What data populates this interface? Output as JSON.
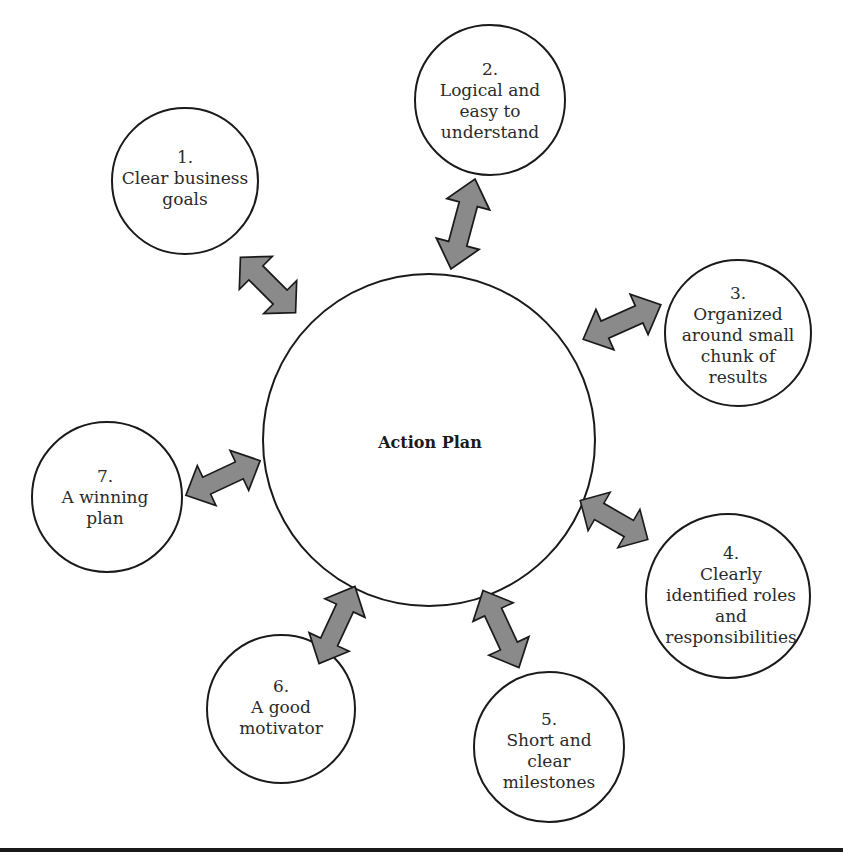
{
  "diagram": {
    "type": "hub-and-spoke",
    "center": {
      "label": "Action Plan"
    },
    "nodes": [
      {
        "number": "1.",
        "lines": [
          "Clear business",
          "goals"
        ]
      },
      {
        "number": "2.",
        "lines": [
          "Logical and",
          "easy to",
          "understand"
        ]
      },
      {
        "number": "3.",
        "lines": [
          "Organized",
          "around small",
          "chunk of",
          "results"
        ]
      },
      {
        "number": "4.",
        "lines": [
          "Clearly",
          "identified roles",
          "and",
          "responsibilities"
        ]
      },
      {
        "number": "5.",
        "lines": [
          "Short and",
          "clear",
          "milestones"
        ]
      },
      {
        "number": "6.",
        "lines": [
          "A good",
          "motivator"
        ]
      },
      {
        "number": "7.",
        "lines": [
          "A winning",
          "plan"
        ]
      }
    ],
    "connector": "double-headed-arrow",
    "colors": {
      "arrow_fill": "#8a8a8a",
      "stroke": "#1a1a1a",
      "background": "#ffffff"
    }
  }
}
